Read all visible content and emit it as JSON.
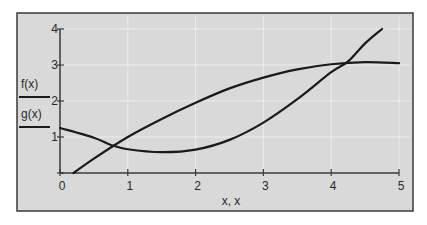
{
  "chart_data": {
    "type": "line",
    "title": "",
    "xlabel": "x, x",
    "ylabel": "",
    "xlim": [
      0,
      5
    ],
    "ylim": [
      0,
      4
    ],
    "x_ticks": [
      "0",
      "1",
      "2",
      "3",
      "4",
      "5"
    ],
    "y_ticks": [
      "1",
      "2",
      "3",
      "4"
    ],
    "grid": true,
    "legend_position": "left",
    "series": [
      {
        "name": "f(x)",
        "points": [
          [
            0.2,
            0
          ],
          [
            0.5,
            0.4
          ],
          [
            1,
            1.0
          ],
          [
            1.5,
            1.5
          ],
          [
            2,
            1.95
          ],
          [
            2.5,
            2.35
          ],
          [
            3,
            2.65
          ],
          [
            3.5,
            2.88
          ],
          [
            4,
            3.02
          ],
          [
            4.5,
            3.08
          ],
          [
            5,
            3.05
          ]
        ]
      },
      {
        "name": "g(x)",
        "points": [
          [
            0,
            1.25
          ],
          [
            0.5,
            0.98
          ],
          [
            0.75,
            0.78
          ],
          [
            1,
            0.66
          ],
          [
            1.5,
            0.58
          ],
          [
            2,
            0.65
          ],
          [
            2.5,
            0.92
          ],
          [
            3,
            1.4
          ],
          [
            3.5,
            2.05
          ],
          [
            4,
            2.8
          ],
          [
            4.25,
            3.1
          ],
          [
            4.5,
            3.6
          ],
          [
            4.75,
            4.0
          ]
        ]
      }
    ]
  },
  "colors": {
    "plot_background": "#d9d9d9",
    "frame": "#3a3a3a",
    "line": "#1a1a1a",
    "grid": "#ececec",
    "text": "#2a2a2a"
  }
}
